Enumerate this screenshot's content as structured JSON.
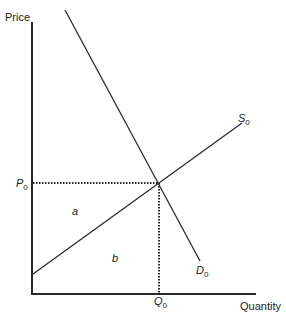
{
  "diagram": {
    "type": "supply-demand",
    "axes": {
      "y_label": "Price",
      "x_label": "Quantity"
    },
    "curves": {
      "supply": {
        "name": "S",
        "subscript": "0"
      },
      "demand": {
        "name": "D",
        "subscript": "0"
      }
    },
    "equilibrium": {
      "price": {
        "name": "P",
        "subscript": "0"
      },
      "quantity": {
        "name": "Q",
        "subscript": "0"
      }
    },
    "regions": {
      "a": "a",
      "b": "b"
    },
    "colors": {
      "line": "#2a2a2a",
      "text": "#222222",
      "background": "#ffffff"
    }
  }
}
